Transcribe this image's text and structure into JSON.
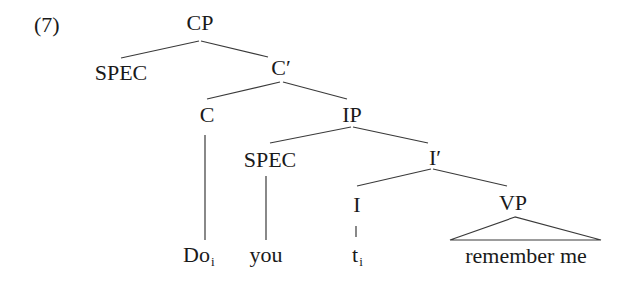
{
  "example_number": "(7)",
  "nodes": {
    "cp": "CP",
    "spec_cp": "SPEC",
    "c_bar": "C′",
    "c": "C",
    "ip": "IP",
    "spec_ip": "SPEC",
    "i_bar": "I′",
    "i": "I",
    "vp": "VP"
  },
  "leaves": {
    "do": {
      "text": "Do",
      "subscript": "i"
    },
    "you": {
      "text": "you"
    },
    "trace": {
      "text": "t",
      "subscript": "i"
    },
    "vp_content": {
      "text": "remember me"
    }
  },
  "tree_structure": [
    {
      "parent": "CP",
      "children": [
        "SPEC",
        "C′"
      ]
    },
    {
      "parent": "C′",
      "children": [
        "C",
        "IP"
      ]
    },
    {
      "parent": "C",
      "children": [
        "Do_i"
      ]
    },
    {
      "parent": "IP",
      "children": [
        "SPEC",
        "I′"
      ]
    },
    {
      "parent": "SPEC",
      "children": [
        "you"
      ]
    },
    {
      "parent": "I′",
      "children": [
        "I",
        "VP"
      ]
    },
    {
      "parent": "I",
      "children": [
        "t_i"
      ]
    },
    {
      "parent": "VP",
      "children": [
        "remember me (triangle)"
      ]
    }
  ]
}
